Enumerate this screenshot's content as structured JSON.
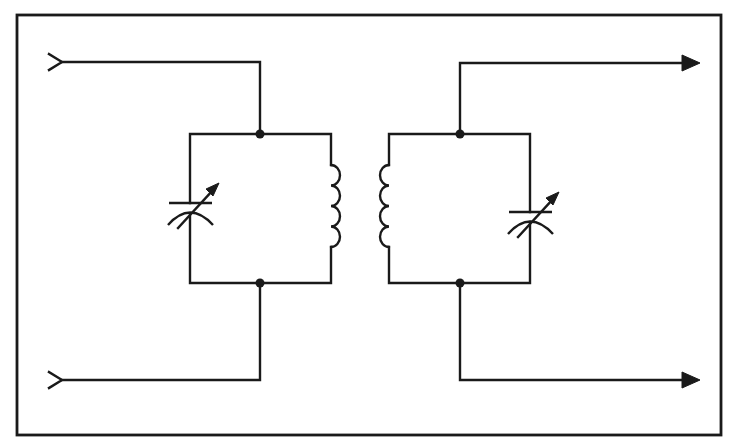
{
  "diagram": {
    "colors": {
      "ink": "#1a1a1a",
      "background": "#ffffff"
    },
    "frame": {
      "x": 17,
      "y": 15,
      "width": 704,
      "height": 420
    },
    "components": [
      {
        "id": "input-top",
        "type": "input-terminal",
        "symbol": "chevron",
        "x": 56,
        "y": 62
      },
      {
        "id": "input-bottom",
        "type": "input-terminal",
        "symbol": "chevron",
        "x": 56,
        "y": 380
      },
      {
        "id": "C1",
        "type": "variable-capacitor",
        "position": "left tank",
        "x": 190,
        "y": 208
      },
      {
        "id": "L1",
        "type": "inductor",
        "position": "left tank (primary)",
        "turns": 4,
        "x": 331,
        "y": 206
      },
      {
        "id": "L2",
        "type": "inductor",
        "position": "right tank (secondary)",
        "turns": 4,
        "x": 389,
        "y": 206
      },
      {
        "id": "C2",
        "type": "variable-capacitor",
        "position": "right tank",
        "x": 530,
        "y": 217
      },
      {
        "id": "output-top",
        "type": "output-terminal",
        "symbol": "arrow",
        "x": 700,
        "y": 63
      },
      {
        "id": "output-bottom",
        "type": "output-terminal",
        "symbol": "arrow",
        "x": 700,
        "y": 380
      }
    ],
    "junctions": [
      {
        "x": 260,
        "y": 134
      },
      {
        "x": 260,
        "y": 283
      },
      {
        "x": 460,
        "y": 134
      },
      {
        "x": 460,
        "y": 283
      }
    ],
    "labels": {
      "input_top": "input-top",
      "input_bottom": "input-bottom",
      "output_top": "output-top",
      "output_bottom": "output-bottom",
      "c1": "C1",
      "l1": "L1",
      "l2": "L2",
      "c2": "C2"
    }
  }
}
